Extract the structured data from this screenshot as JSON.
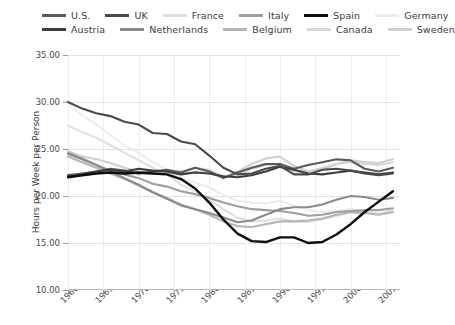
{
  "chart_data": {
    "type": "line",
    "title": "",
    "xlabel": "",
    "ylabel": "Hours per Week per Person",
    "xlim": [
      1960,
      2007
    ],
    "ylim": [
      10.0,
      35.0
    ],
    "ytick_labels": [
      "35.00",
      "30.00",
      "25.00",
      "20.00",
      "15.00",
      "10.00"
    ],
    "ytick_values": [
      35.0,
      30.0,
      25.0,
      20.0,
      15.0,
      10.0
    ],
    "xtick_labels": [
      "1960",
      "1965",
      "1970",
      "1975",
      "1980",
      "1985",
      "1990",
      "1995",
      "2000",
      "2005"
    ],
    "xtick_values": [
      1960,
      1965,
      1970,
      1975,
      1980,
      1985,
      1990,
      1995,
      2000,
      2005
    ],
    "grid": true,
    "legend_position": "top",
    "x": [
      1960,
      1962,
      1964,
      1966,
      1968,
      1970,
      1972,
      1974,
      1976,
      1978,
      1980,
      1982,
      1984,
      1986,
      1988,
      1990,
      1992,
      1994,
      1996,
      1998,
      2000,
      2002,
      2004,
      2006
    ],
    "series": [
      {
        "name": "U.S.",
        "color": "#5a5a5a",
        "width": 2.1,
        "values": [
          22.2,
          22.4,
          22.6,
          22.9,
          22.7,
          22.4,
          22.6,
          22.8,
          22.5,
          23.0,
          22.6,
          21.9,
          22.5,
          23.0,
          23.4,
          23.4,
          22.9,
          23.3,
          23.6,
          23.9,
          23.8,
          22.9,
          22.6,
          23.0
        ]
      },
      {
        "name": "UK",
        "color": "#4a4a4a",
        "width": 2.1,
        "values": [
          30.0,
          29.3,
          28.8,
          28.5,
          27.9,
          27.6,
          26.7,
          26.6,
          25.8,
          25.5,
          24.3,
          23.0,
          22.3,
          22.4,
          22.9,
          23.2,
          22.3,
          22.3,
          22.8,
          22.9,
          22.7,
          22.4,
          22.2,
          22.4
        ]
      },
      {
        "name": "France",
        "color": "#e0e0e0",
        "width": 2.1,
        "values": [
          27.5,
          26.8,
          26.2,
          25.4,
          24.6,
          23.8,
          23.0,
          22.3,
          21.2,
          20.5,
          19.6,
          18.6,
          17.7,
          17.3,
          17.4,
          17.6,
          17.3,
          17.2,
          17.5,
          17.9,
          18.2,
          18.2,
          18.1,
          18.4
        ]
      },
      {
        "name": "Italy",
        "color": "#9e9e9e",
        "width": 2.1,
        "values": [
          24.6,
          24.0,
          23.3,
          22.7,
          22.3,
          21.9,
          21.3,
          21.0,
          20.5,
          20.2,
          19.8,
          19.3,
          18.9,
          18.6,
          18.5,
          18.4,
          18.2,
          17.9,
          18.0,
          18.3,
          18.4,
          18.5,
          18.5,
          18.7
        ]
      },
      {
        "name": "Spain",
        "color": "#0d0d0d",
        "width": 2.4,
        "values": [
          22.0,
          22.2,
          22.4,
          22.5,
          22.4,
          22.5,
          22.4,
          22.3,
          21.8,
          20.8,
          19.3,
          17.5,
          16.0,
          15.2,
          15.1,
          15.6,
          15.6,
          15.0,
          15.1,
          15.9,
          17.0,
          18.3,
          19.4,
          20.5
        ]
      },
      {
        "name": "Germany",
        "color": "#ececec",
        "width": 2.1,
        "values": [
          29.8,
          28.6,
          27.6,
          26.5,
          25.4,
          24.6,
          23.6,
          22.8,
          21.9,
          21.4,
          20.9,
          20.1,
          19.5,
          19.3,
          19.2,
          19.5,
          19.0,
          18.5,
          18.3,
          18.4,
          18.6,
          18.3,
          18.1,
          18.5
        ]
      },
      {
        "name": "Austria",
        "color": "#3d3d3d",
        "width": 2.1,
        "values": [
          22.1,
          22.3,
          22.6,
          22.8,
          22.6,
          22.9,
          22.7,
          22.6,
          22.3,
          22.5,
          22.4,
          22.1,
          22.0,
          22.2,
          22.6,
          23.1,
          22.8,
          22.4,
          22.3,
          22.5,
          22.7,
          22.5,
          22.3,
          22.5
        ]
      },
      {
        "name": "Netherlands",
        "color": "#8a8a8a",
        "width": 2.1,
        "values": [
          24.5,
          23.9,
          23.3,
          22.6,
          21.9,
          21.2,
          20.4,
          19.7,
          19.0,
          18.6,
          18.2,
          17.7,
          17.2,
          17.4,
          18.0,
          18.6,
          18.8,
          18.8,
          19.1,
          19.6,
          20.0,
          19.9,
          19.6,
          19.8
        ]
      },
      {
        "name": "Belgium",
        "color": "#b5b5b5",
        "width": 2.1,
        "values": [
          24.2,
          23.6,
          23.0,
          22.4,
          21.8,
          21.1,
          20.4,
          19.8,
          19.1,
          18.6,
          18.0,
          17.3,
          16.8,
          16.7,
          17.0,
          17.3,
          17.3,
          17.4,
          17.6,
          18.0,
          18.3,
          18.2,
          18.0,
          18.3
        ]
      },
      {
        "name": "Canada",
        "color": "#d6d6d6",
        "width": 2.1,
        "values": [
          22.3,
          22.2,
          22.4,
          22.6,
          22.5,
          22.3,
          22.4,
          22.7,
          22.6,
          23.0,
          22.8,
          22.0,
          22.3,
          22.9,
          23.3,
          23.3,
          22.6,
          22.6,
          23.0,
          23.4,
          23.6,
          23.4,
          23.3,
          23.6
        ]
      },
      {
        "name": "Sweden",
        "color": "#cfcfcf",
        "width": 2.1,
        "values": [
          24.8,
          24.2,
          23.9,
          23.5,
          23.0,
          22.6,
          22.4,
          22.5,
          22.3,
          22.6,
          22.4,
          22.0,
          22.6,
          23.4,
          24.0,
          24.2,
          23.2,
          22.6,
          22.8,
          23.4,
          23.8,
          23.6,
          23.5,
          23.9
        ]
      }
    ]
  },
  "legend": {
    "row1": [
      {
        "label": "U.S."
      },
      {
        "label": "UK"
      },
      {
        "label": "France"
      },
      {
        "label": "Italy"
      },
      {
        "label": "Spain"
      },
      {
        "label": "Germany"
      }
    ],
    "row2": [
      {
        "label": "Austria"
      },
      {
        "label": "Netherlands"
      },
      {
        "label": "Belgium"
      },
      {
        "label": "Canada"
      },
      {
        "label": "Sweden"
      }
    ]
  }
}
